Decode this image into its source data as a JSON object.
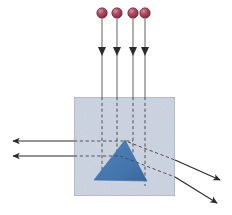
{
  "figure": {
    "type": "physics-ray-diagram",
    "canvas": {
      "width": 232,
      "height": 215
    },
    "background_color": "#ffffff"
  },
  "colors": {
    "sphere_fill": "#b04a5e",
    "sphere_fill_dark": "#7d2b3d",
    "sphere_highlight": "#d98b9c",
    "sphere_stroke": "#6e2434",
    "block_fill": "#ccd4e2",
    "block_stroke": "#9aa3b4",
    "prism_fill": "#4a7ab4",
    "prism_fill_dark": "#3b6aa3",
    "ray_stroke": "#2b2b2b",
    "dashed_stroke": "#4a4a4a",
    "stem_stroke": "#6f6f6f"
  },
  "sources": {
    "label": "point light sources",
    "count": 4,
    "radius": 5.2,
    "items": [
      {
        "name": "source-1",
        "cx": 102,
        "cy": 13
      },
      {
        "name": "source-2",
        "cx": 117,
        "cy": 13
      },
      {
        "name": "source-3",
        "cx": 133,
        "cy": 13
      },
      {
        "name": "source-4",
        "cx": 145,
        "cy": 13
      }
    ]
  },
  "incident_rays": {
    "label": "incident downward rays",
    "count": 4,
    "arrowhead_y": 53,
    "items": [
      {
        "name": "incident-ray-1",
        "x": 102,
        "y_start": 19,
        "y_end": 97
      },
      {
        "name": "incident-ray-2",
        "x": 117,
        "y_start": 19,
        "y_end": 97
      },
      {
        "name": "incident-ray-3",
        "x": 133,
        "y_start": 19,
        "y_end": 97
      },
      {
        "name": "incident-ray-4",
        "x": 145,
        "y_start": 19,
        "y_end": 97
      }
    ]
  },
  "block": {
    "label": "transparent medium block",
    "x": 74,
    "y": 97,
    "width": 101,
    "height": 99
  },
  "prism": {
    "label": "triangular prism",
    "apex": {
      "x": 125,
      "y": 140
    },
    "base_left": {
      "x": 94,
      "y": 180
    },
    "base_right": {
      "x": 147,
      "y": 181
    }
  },
  "internal_dashed_rays": {
    "label": "dashed ray continuations inside the block",
    "vertical": [
      {
        "name": "dashed-vertical-1",
        "x": 102,
        "y_start": 97,
        "y_end": 177
      },
      {
        "name": "dashed-vertical-2",
        "x": 117,
        "y_start": 97,
        "y_end": 165
      },
      {
        "name": "dashed-vertical-3",
        "x": 133,
        "y_start": 97,
        "y_end": 168
      },
      {
        "name": "dashed-vertical-4",
        "x": 145,
        "y_start": 97,
        "y_end": 186
      }
    ],
    "horizontal": [
      {
        "name": "dashed-horizontal-1",
        "y": 141,
        "x_start": 74,
        "x_end": 133
      },
      {
        "name": "dashed-horizontal-2",
        "y": 156,
        "x_start": 74,
        "x_end": 120
      }
    ],
    "diagonal": [
      {
        "name": "dashed-diagonal-1",
        "x1": 128,
        "y1": 142,
        "x2": 175,
        "y2": 160
      },
      {
        "name": "dashed-diagonal-2",
        "x1": 120,
        "y1": 156,
        "x2": 175,
        "y2": 177
      }
    ]
  },
  "exit_rays": {
    "label": "refracted exit rays",
    "left": [
      {
        "name": "exit-ray-left-1",
        "x_start": 74,
        "x_end": 11,
        "y": 141
      },
      {
        "name": "exit-ray-left-2",
        "x_start": 74,
        "x_end": 11,
        "y": 156
      }
    ],
    "right": [
      {
        "name": "exit-ray-right-1",
        "x1": 160,
        "y1": 155,
        "x2": 222,
        "y2": 183
      },
      {
        "name": "exit-ray-right-2",
        "x1": 160,
        "y1": 170,
        "x2": 219,
        "y2": 205
      }
    ]
  }
}
